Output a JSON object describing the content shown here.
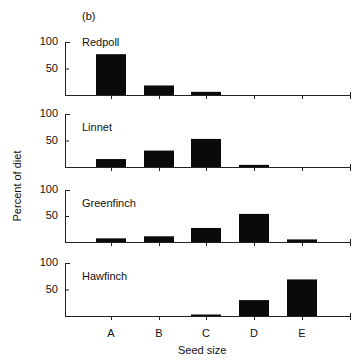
{
  "figure": {
    "label": "(b)",
    "ylabel": "Percent of diet",
    "xlabel": "Seed size",
    "yticks": [
      "100",
      "50"
    ]
  },
  "chart_data": {
    "type": "bar",
    "title": "(b)",
    "xlabel": "Seed size",
    "ylabel": "Percent of diet",
    "categories": [
      "A",
      "B",
      "C",
      "D",
      "E"
    ],
    "ylim": [
      0,
      100
    ],
    "yticks": [
      50,
      100
    ],
    "grid": false,
    "layout": "4 vertically stacked panels sharing x-axis",
    "series": [
      {
        "name": "Redpoll",
        "values": [
          77,
          18,
          6,
          0,
          0
        ]
      },
      {
        "name": "Linnet",
        "values": [
          15,
          31,
          53,
          4,
          0
        ]
      },
      {
        "name": "Greenfinch",
        "values": [
          7,
          11,
          27,
          54,
          5
        ]
      },
      {
        "name": "Hawfinch",
        "values": [
          0,
          0,
          2,
          30,
          69
        ]
      }
    ]
  }
}
